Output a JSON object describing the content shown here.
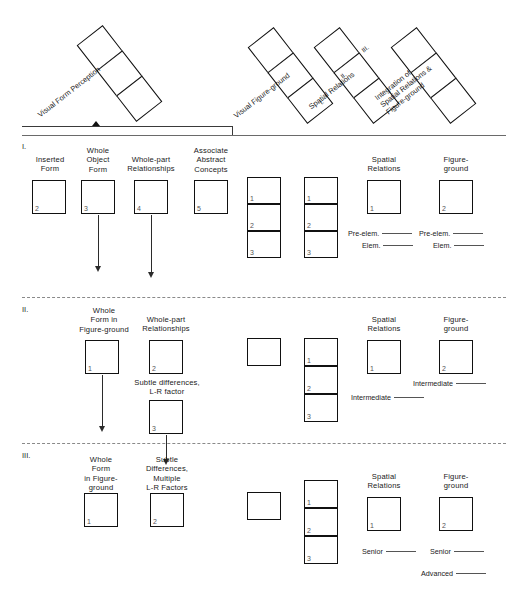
{
  "figure": {
    "towers": [
      {
        "label": "Visual Form Perception",
        "numerals": []
      },
      {
        "label": "Visual Figure-ground",
        "numerals": []
      },
      {
        "label": "Spatial Relations",
        "numerals": [
          "I.",
          "II.",
          "III."
        ]
      },
      {
        "label": "Integration of\nSpatial Relations &\nFigure-ground",
        "numerals": []
      }
    ],
    "sections": [
      {
        "numeral": "I.",
        "left_boxes": [
          {
            "caption": "Inserted\nForm",
            "num": "2",
            "arrow": false
          },
          {
            "caption": "Whole\nObject\nForm",
            "num": "3",
            "arrow": true
          },
          {
            "caption": "Whole-part\nRelationships",
            "num": "4",
            "arrow": true
          },
          {
            "caption": "Associate\nAbstract\nConcepts",
            "num": "5",
            "arrow": false
          }
        ],
        "stacks": [
          {
            "cells": [
              "1",
              "2",
              "3"
            ]
          },
          {
            "cells": [
              "1",
              "2",
              "3"
            ]
          }
        ],
        "right_boxes": [
          {
            "caption": "Spatial\nRelations",
            "num": "1"
          },
          {
            "caption": "Figure-\nground",
            "num": "2"
          }
        ],
        "levels": [
          {
            "column": "spatial",
            "items": [
              "Pre-elem.",
              "Elem."
            ]
          },
          {
            "column": "figure",
            "items": [
              "Pre-elem.",
              "Elem."
            ]
          }
        ]
      },
      {
        "numeral": "II.",
        "left_boxes": [
          {
            "caption": "Whole\nForm in\nFigure-ground",
            "num": "1",
            "arrow": true
          },
          {
            "caption": "Whole-part\nRelationships",
            "num": "2",
            "arrow": false
          },
          {
            "caption": "Subtle differences,\nL-R factor",
            "num": "3",
            "arrow": true
          }
        ],
        "stacks": [
          {
            "cells": [
              ""
            ]
          },
          {
            "cells": [
              "1",
              "2",
              "3"
            ]
          }
        ],
        "right_boxes": [
          {
            "caption": "Spatial\nRelations",
            "num": "1"
          },
          {
            "caption": "Figure-\nground",
            "num": "2"
          }
        ],
        "levels": [
          {
            "column": "spatial",
            "items": [
              "Intermediate"
            ]
          },
          {
            "column": "figure",
            "items": [
              "Intermediate"
            ]
          }
        ]
      },
      {
        "numeral": "III.",
        "left_boxes": [
          {
            "caption": "Whole\nForm\nin Figure-\nground",
            "num": "1",
            "arrow": false
          },
          {
            "caption": "Subtle\nDifferences,\nMultiple\nL-R Factors",
            "num": "2",
            "arrow": false
          }
        ],
        "stacks": [
          {
            "cells": [
              ""
            ]
          },
          {
            "cells": [
              "1",
              "2",
              "3"
            ]
          }
        ],
        "right_boxes": [
          {
            "caption": "Spatial\nRelations",
            "num": "1"
          },
          {
            "caption": "Figure-\nground",
            "num": "2"
          }
        ],
        "levels": [
          {
            "column": "spatial",
            "items": [
              "Senior"
            ]
          },
          {
            "column": "figure",
            "items": [
              "Senior",
              "Advanced"
            ]
          }
        ]
      }
    ]
  }
}
